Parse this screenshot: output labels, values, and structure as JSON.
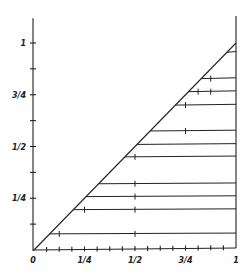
{
  "diagram": {
    "origin_label": "0",
    "x_axis": {
      "tick_labels": [
        "1/4",
        "1/2",
        "3/4",
        "1"
      ],
      "tick_values": [
        0.25,
        0.5,
        0.75,
        1
      ],
      "minor_ticks": [
        0.0625,
        0.125,
        0.1875,
        0.25,
        0.3125,
        0.375,
        0.4375,
        0.5,
        0.5625,
        0.625,
        0.6875,
        0.75,
        0.8125,
        0.875,
        0.9375
      ]
    },
    "y_axis": {
      "tick_labels": [
        "1/4",
        "1/2",
        "3/4",
        "1"
      ],
      "tick_values": [
        0.25,
        0.5,
        0.75,
        1
      ],
      "minor_ticks": [
        0.125,
        0.25,
        0.375,
        0.5,
        0.625,
        0.75,
        0.875,
        1
      ]
    },
    "horizontal_lines": [
      {
        "y": 0.078,
        "ticks": [
          0.125,
          0.5
        ]
      },
      {
        "y": 0.195,
        "ticks": [
          0.25,
          0.5
        ]
      },
      {
        "y": 0.258,
        "ticks": [
          0.1875,
          0.25,
          0.5
        ]
      },
      {
        "y": 0.32,
        "ticks": [
          0.25,
          0.5
        ]
      },
      {
        "y": 0.45,
        "ticks": [
          0.5
        ]
      },
      {
        "y": 0.51,
        "ticks": [
          0.5
        ]
      },
      {
        "y": 0.575,
        "ticks": [
          0.5,
          0.5625,
          0.75
        ]
      },
      {
        "y": 0.7,
        "ticks": [
          0.625,
          0.75
        ]
      },
      {
        "y": 0.765,
        "ticks": [
          0.8125,
          0.875
        ]
      },
      {
        "y": 0.828,
        "ticks": [
          0.875
        ]
      },
      {
        "y": 0.955,
        "ticks": []
      }
    ],
    "line_color": "#222222",
    "background": "#ffffff"
  }
}
